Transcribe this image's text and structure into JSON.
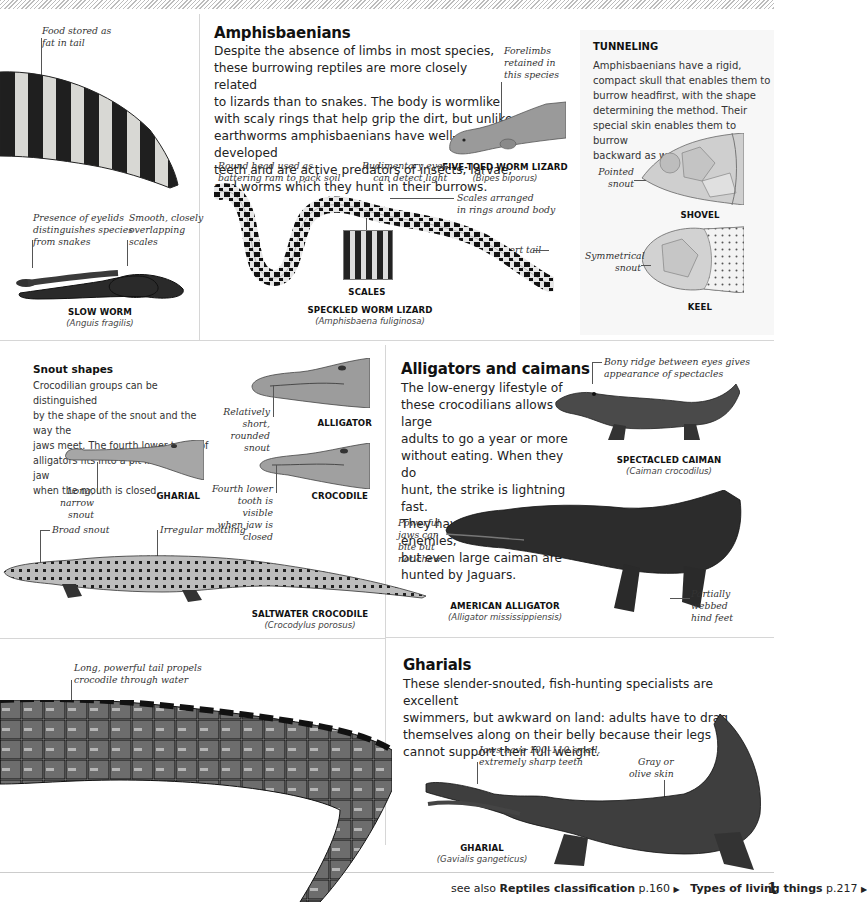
{
  "amphisbaenians": {
    "title": "Amphisbaenians",
    "body": "Despite the absence of limbs in most species, these burrowing reptiles are more closely related to lizards than to snakes. The body is wormlike with scaly rings that help grip the dirt, but unlike earthworms amphisbaenians have well-developed teeth and are active predators of insects, larvae, and worms which they hunt in their burrows.",
    "body_lines": [
      "Despite the absence of limbs in most species,",
      "these burrowing reptiles are more closely related",
      "to lizards than to snakes. The body is wormlike",
      "with scaly rings that help grip the dirt, but unlike",
      "earthworms amphisbaenians have well-developed",
      "teeth and are active predators of insects, larvae,",
      "and worms which they hunt in their burrows."
    ],
    "notes": {
      "forelimbs": [
        "Forelimbs",
        "retained in",
        "this species"
      ],
      "round_head": [
        "Round head used as",
        "battering ram to pack soil"
      ],
      "rudimentary_eyes": [
        "Rudimentary eyes",
        "can detect light"
      ],
      "scales_rings": [
        "Scales arranged",
        "in rings around body"
      ],
      "short_tail": "Short tail"
    },
    "five_toed": {
      "name": "FIVE-TOED WORM LIZARD",
      "sci": "(Bipes biporus)"
    },
    "scales_label": "SCALES",
    "speckled": {
      "name": "SPECKLED WORM LIZARD",
      "sci": "(Amphisbaena fuliginosa)"
    }
  },
  "left_top": {
    "note_food": [
      "Food stored as",
      "fat in tail"
    ],
    "note_eyelids": [
      "Presence of eyelids",
      "distinguishes species",
      "from snakes"
    ],
    "note_scales": [
      "Smooth, closely",
      "overlapping",
      "scales"
    ],
    "slow_worm": {
      "name": "SLOW WORM",
      "sci": "(Anguis fragilis)"
    }
  },
  "tunneling": {
    "title": "TUNNELING",
    "body_lines": [
      "Amphisbaenians have a rigid,",
      "compact skull that enables them to",
      "burrow headfirst, with the shape",
      "determining the method. Their",
      "special skin enables them to burrow",
      "backward as well."
    ],
    "shovel": {
      "note": [
        "Pointed",
        "snout"
      ],
      "label": "SHOVEL"
    },
    "keel": {
      "note": [
        "Symmetrical",
        "snout"
      ],
      "label": "KEEL"
    }
  },
  "snout_shapes": {
    "title": "Snout shapes",
    "body_lines": [
      "Crocodilian groups can be distinguished",
      "by the shape of the snout and the way the",
      "jaws meet. The fourth lower tooth of",
      "alligators fits into a pit in the upper jaw",
      "when the mouth is closed."
    ],
    "alligator": {
      "note": [
        "Relatively short,",
        "rounded snout"
      ],
      "label": "ALLIGATOR"
    },
    "gharial": {
      "note": [
        "Long, narrow",
        "snout"
      ],
      "label": "GHARIAL"
    },
    "crocodile": {
      "note": [
        "Fourth lower",
        "tooth is visible",
        "when jaw is closed"
      ],
      "label": "CROCODILE"
    }
  },
  "saltwater": {
    "note_snout": "Broad snout",
    "note_mottling": "Irregular mottling",
    "name": "SALTWATER CROCODILE",
    "sci": "(Crocodylus porosus)"
  },
  "alligators_caimans": {
    "title": "Alligators and caimans",
    "body_lines": [
      "The low-energy lifestyle of",
      "these crocodilians allows large",
      "adults to go a year or more",
      "without eating. When they do",
      "hunt, the strike is lightning fast.",
      "They have few natural enemies,",
      "but even large caiman are",
      "hunted by Jaguars."
    ],
    "note_bony": [
      "Bony ridge between eyes gives",
      "appearance of spectacles"
    ],
    "spectacled": {
      "name": "SPECTACLED CAIMAN",
      "sci": "(Caiman crocodilus)"
    },
    "note_jaws": [
      "Powerful",
      "jaws can",
      "bite but",
      "not chew"
    ],
    "note_feet": [
      "Partially",
      "webbed",
      "hind feet"
    ],
    "american": {
      "name": "AMERICAN ALLIGATOR",
      "sci": "(Alligator mississippiensis)"
    }
  },
  "tail": {
    "note": [
      "Long, powerful tail propels",
      "crocodile through water"
    ]
  },
  "gharials": {
    "title": "Gharials",
    "body_lines": [
      "These slender-snouted, fish-hunting specialists are excellent",
      "swimmers, but awkward on land: adults have to drag",
      "themselves along on their belly because their legs",
      "cannot support their full weight."
    ],
    "note_jaws": [
      "Jaws have 100–110 small,",
      "extremely sharp teeth"
    ],
    "note_skin": [
      "Gray or",
      "olive skin"
    ],
    "name": "GHARIAL",
    "sci": "(Gavialis gangeticus)"
  },
  "footer": {
    "see_also": "see also",
    "link1_title": "Reptiles classification",
    "link1_page": "p.160",
    "link2_title": "Types of living things",
    "link2_page": "p.217",
    "arrow": "▶",
    "page_number": "1"
  }
}
